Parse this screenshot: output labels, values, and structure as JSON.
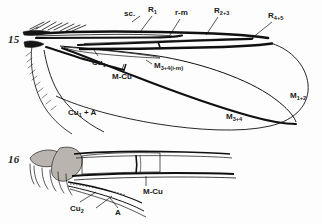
{
  "plate": {
    "description": "Line-drawing plate of dipteran wing venation, two figures",
    "background_color": "#fdfdfd",
    "ink_color": "#101010",
    "shading_color": "#b9b4ae"
  },
  "figures": [
    {
      "number": "15",
      "caption_text": "15",
      "subject": "whole wing, dorsal view, venation labelled",
      "labels": [
        {
          "id": "sc",
          "base": "sc.",
          "sub": "",
          "paren": "",
          "x": 124,
          "y": 10,
          "leader": "dot"
        },
        {
          "id": "r1",
          "base": "R",
          "sub": "1",
          "paren": "",
          "x": 148,
          "y": 6,
          "leader": "line"
        },
        {
          "id": "rm",
          "base": "r-m",
          "sub": "",
          "paren": "",
          "x": 175,
          "y": 9,
          "leader": "line"
        },
        {
          "id": "r23",
          "base": "R",
          "sub": "2+3",
          "paren": "",
          "x": 214,
          "y": 7,
          "leader": "line"
        },
        {
          "id": "r45",
          "base": "R",
          "sub": "4+5",
          "paren": "",
          "x": 268,
          "y": 12,
          "leader": "line"
        },
        {
          "id": "cu1",
          "base": "Cu",
          "sub": "1",
          "paren": "",
          "x": 92,
          "y": 59,
          "leader": "line"
        },
        {
          "id": "mcu",
          "base": "M-Cu",
          "sub": "",
          "paren": "",
          "x": 112,
          "y": 73,
          "leader": "line"
        },
        {
          "id": "m34im",
          "base": "M",
          "sub": "3+4",
          "paren": "(i-m)",
          "x": 154,
          "y": 62,
          "leader": "tick"
        },
        {
          "id": "cu1a",
          "base": "Cu",
          "sub": "1",
          "paren": " + A",
          "x": 68,
          "y": 109,
          "leader": "none"
        },
        {
          "id": "m34",
          "base": "M",
          "sub": "3+4",
          "paren": "",
          "x": 226,
          "y": 113,
          "leader": "none"
        },
        {
          "id": "m12",
          "base": "M",
          "sub": "1+2",
          "paren": "",
          "x": 290,
          "y": 92,
          "leader": "none"
        }
      ]
    },
    {
      "number": "16",
      "caption_text": "16",
      "subject": "wing base, enlarged, anal region labelled",
      "labels": [
        {
          "id": "mcu2",
          "base": "M-Cu",
          "sub": "",
          "paren": "",
          "x": 143,
          "y": 188,
          "leader": "line"
        },
        {
          "id": "cu2",
          "base": "Cu",
          "sub": "2",
          "paren": "",
          "x": 70,
          "y": 205,
          "leader": "line"
        },
        {
          "id": "a",
          "base": "A",
          "sub": "",
          "paren": "",
          "x": 115,
          "y": 209,
          "leader": "line"
        }
      ]
    }
  ]
}
